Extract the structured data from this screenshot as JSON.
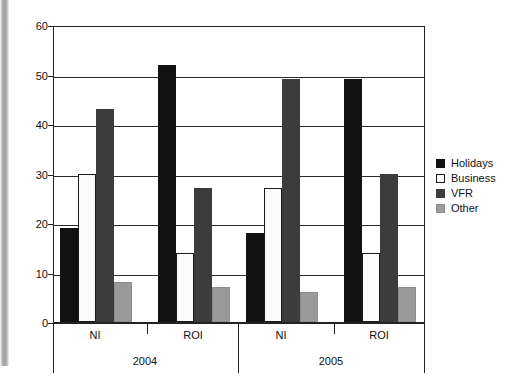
{
  "chart_data": {
    "type": "bar",
    "title": "",
    "subtitle": "",
    "xlabel": "",
    "ylabel": "",
    "ylim": [
      0,
      60
    ],
    "yticks": [
      0,
      10,
      20,
      30,
      40,
      50,
      60
    ],
    "grid": true,
    "legend_position": "right",
    "orientation": "vertical",
    "grouping": "grouped",
    "group_tiers": [
      {
        "level": "region",
        "labels": [
          "NI",
          "ROI",
          "NI",
          "ROI"
        ]
      },
      {
        "level": "year",
        "labels": [
          "2004",
          "2005"
        ]
      }
    ],
    "categories": [
      "NI 2004",
      "ROI 2004",
      "NI 2005",
      "ROI 2005"
    ],
    "series": [
      {
        "name": "Holidays",
        "color": "#111111",
        "values": [
          19,
          52,
          18,
          49
        ]
      },
      {
        "name": "Business",
        "color": "#ffffff",
        "values": [
          30,
          14,
          27,
          14
        ]
      },
      {
        "name": "VFR",
        "color": "#3c3c3c",
        "values": [
          43,
          27,
          49,
          30
        ]
      },
      {
        "name": "Other",
        "color": "#9a9a9a",
        "values": [
          8,
          7,
          6,
          7
        ]
      }
    ]
  },
  "axis": {
    "y_tick_labels": [
      "0",
      "10",
      "20",
      "30",
      "40",
      "50",
      "60"
    ],
    "x_tier1_labels": [
      "NI",
      "ROI",
      "NI",
      "ROI"
    ],
    "x_tier2_labels": [
      "2004",
      "2005"
    ]
  },
  "legend": {
    "items": [
      {
        "label": "Holidays",
        "swatch": "black-square-icon"
      },
      {
        "label": "Business",
        "swatch": "white-square-icon"
      },
      {
        "label": "VFR",
        "swatch": "dark-gray-square-icon"
      },
      {
        "label": "Other",
        "swatch": "gray-square-icon"
      }
    ]
  }
}
